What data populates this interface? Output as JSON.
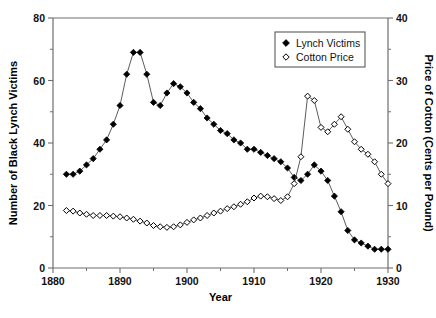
{
  "chart_data": {
    "type": "line",
    "title": "",
    "xlabel": "Year",
    "ylabel": "Number of Black Lynch Victims",
    "y2label": "Price of Cotton (Cents per Pound)",
    "xlim": [
      1880,
      1930
    ],
    "ylim": [
      0,
      80
    ],
    "y2lim": [
      0,
      40
    ],
    "xticks": [
      1880,
      1890,
      1900,
      1910,
      1920,
      1930
    ],
    "xtick_labels": [
      "1880",
      "1890",
      "1900",
      "1910",
      "1920",
      "1930"
    ],
    "xminor_step": 5,
    "yticks": [
      0,
      20,
      40,
      60,
      80
    ],
    "ytick_labels": [
      "0",
      "20",
      "40",
      "60",
      "80"
    ],
    "yminor_step": 10,
    "y2ticks": [
      0,
      10,
      20,
      30,
      40
    ],
    "y2tick_labels": [
      "0",
      "10",
      "20",
      "30",
      "40"
    ],
    "y2minor_step": 5,
    "grid": false,
    "legend_position": "top-right",
    "series": [
      {
        "name": "Lynch Victims",
        "axis": "left",
        "marker": "filled-diamond",
        "color": "#000000",
        "x": [
          1882,
          1883,
          1884,
          1885,
          1886,
          1887,
          1888,
          1889,
          1890,
          1891,
          1892,
          1893,
          1894,
          1895,
          1896,
          1897,
          1898,
          1899,
          1900,
          1901,
          1902,
          1903,
          1904,
          1905,
          1906,
          1907,
          1908,
          1909,
          1910,
          1911,
          1912,
          1913,
          1914,
          1915,
          1916,
          1917,
          1918,
          1919,
          1920,
          1921,
          1922,
          1923,
          1924,
          1925,
          1926,
          1927,
          1928,
          1929,
          1930
        ],
        "values": [
          30,
          30,
          31,
          33,
          35,
          38,
          41,
          46,
          52,
          62,
          69,
          69,
          62,
          53,
          52,
          56,
          59,
          58,
          56,
          53,
          51,
          48,
          46,
          44,
          43,
          41,
          40,
          38,
          38,
          37,
          36,
          35,
          34,
          32,
          29,
          28,
          30,
          33,
          31,
          28,
          23,
          18,
          12,
          9,
          8,
          7,
          6,
          6,
          6
        ]
      },
      {
        "name": "Cotton Price",
        "axis": "right",
        "marker": "open-diamond",
        "color": "#000000",
        "x": [
          1882,
          1883,
          1884,
          1885,
          1886,
          1887,
          1888,
          1889,
          1890,
          1891,
          1892,
          1893,
          1894,
          1895,
          1896,
          1897,
          1898,
          1899,
          1900,
          1901,
          1902,
          1903,
          1904,
          1905,
          1906,
          1907,
          1908,
          1909,
          1910,
          1911,
          1912,
          1913,
          1914,
          1915,
          1916,
          1917,
          1918,
          1919,
          1920,
          1921,
          1922,
          1923,
          1924,
          1925,
          1926,
          1927,
          1928,
          1929,
          1930
        ],
        "values": [
          9.2,
          9.1,
          8.8,
          8.6,
          8.4,
          8.4,
          8.4,
          8.3,
          8.2,
          8.0,
          7.8,
          7.5,
          7.2,
          6.8,
          6.6,
          6.5,
          6.6,
          6.9,
          7.3,
          7.7,
          8.0,
          8.4,
          8.8,
          9.1,
          9.5,
          9.8,
          10.2,
          10.6,
          11.2,
          11.5,
          11.4,
          11.1,
          10.8,
          11.4,
          13.5,
          17.8,
          27.5,
          26.8,
          22.5,
          21.8,
          23.0,
          24.2,
          22.2,
          20.2,
          19.0,
          18.2,
          17.0,
          15.0,
          13.5
        ]
      }
    ],
    "legend_entries": [
      {
        "label": "Lynch Victims",
        "marker": "filled-diamond"
      },
      {
        "label": "Cotton Price",
        "marker": "open-diamond"
      }
    ]
  }
}
